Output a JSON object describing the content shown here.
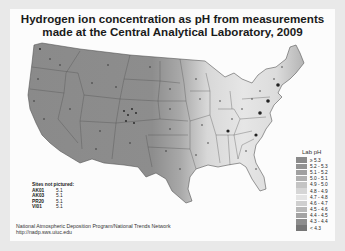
{
  "title": {
    "line1": "Hydrogen ion concentration as pH from measurements",
    "line2": "made at the Central Analytical Laboratory, 2009"
  },
  "legend": {
    "title": "Lab pH",
    "items": [
      {
        "label": "≥ 5.3",
        "color": "#8a8a8a"
      },
      {
        "label": "5.2 - 5.3",
        "color": "#939393"
      },
      {
        "label": "5.1 - 5.2",
        "color": "#a0a0a0"
      },
      {
        "label": "5.0 - 5.1",
        "color": "#b0b0b0"
      },
      {
        "label": "4.9 - 5.0",
        "color": "#c4c4c4"
      },
      {
        "label": "4.8 - 4.9",
        "color": "#d6d6d6"
      },
      {
        "label": "4.7 - 4.8",
        "color": "#e4e4e4"
      },
      {
        "label": "4.6 - 4.7",
        "color": "#cfcfcf"
      },
      {
        "label": "4.5 - 4.6",
        "color": "#b8b8b8"
      },
      {
        "label": "4.4 - 4.5",
        "color": "#a3a3a3"
      },
      {
        "label": "4.3 - 4.4",
        "color": "#8d8d8d"
      },
      {
        "label": "< 4.3",
        "color": "#767676"
      }
    ]
  },
  "sites_not_pictured": {
    "header": "Sites not pictured:",
    "rows": [
      {
        "site": "AK01",
        "value": "5.1"
      },
      {
        "site": "AK03",
        "value": "5.1"
      },
      {
        "site": "PR20",
        "value": "5.1"
      },
      {
        "site": "VI01",
        "value": "5.1"
      }
    ]
  },
  "credit": {
    "line1": "National Atmospheric Deposition Program/National Trends Network",
    "line2": "http://nadp.sws.uiuc.edu"
  }
}
